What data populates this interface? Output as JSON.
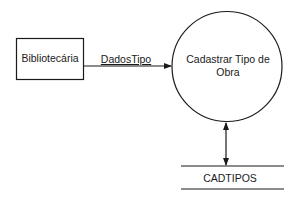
{
  "diagram": {
    "type": "data-flow-diagram",
    "external_entity": {
      "label": "Bibliotecária"
    },
    "process": {
      "label_line1": "Cadastrar Tipo de",
      "label_line2": "Obra"
    },
    "data_flow": {
      "label": "DadosTipo",
      "from": "Bibliotecária",
      "to": "Cadastrar Tipo de Obra"
    },
    "data_store": {
      "label": "CADTIPOS"
    },
    "store_connection": {
      "direction": "bidirectional",
      "between": [
        "Cadastrar Tipo de Obra",
        "CADTIPOS"
      ]
    },
    "colors": {
      "stroke": "#1a1a1a",
      "background": "#ffffff"
    }
  }
}
